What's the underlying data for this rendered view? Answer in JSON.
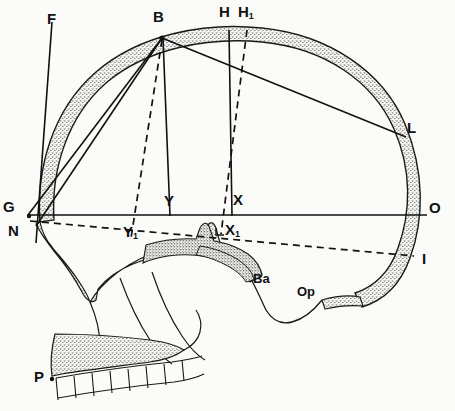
{
  "figure": {
    "caption": "",
    "background_color": "#fbfbfa",
    "ink_color": "#111111",
    "bone_fill_color": "#9a9a95"
  },
  "landmarks": [
    {
      "id": "F",
      "label": "F",
      "name": "frankfurt-reference-line-marker",
      "x": 52,
      "y": 20,
      "anchor_x": 52,
      "anchor_y": 22
    },
    {
      "id": "B",
      "label": "B",
      "name": "bregma",
      "x": 158,
      "y": 18,
      "anchor_x": 162,
      "anchor_y": 38
    },
    {
      "id": "H",
      "label": "H",
      "name": "vertex-height",
      "x": 225,
      "y": 14,
      "anchor_x": 230,
      "anchor_y": 30
    },
    {
      "id": "H1",
      "label": "H",
      "sub": "1",
      "name": "vertex-height-alt",
      "x": 243,
      "y": 14,
      "anchor_x": 248,
      "anchor_y": 30
    },
    {
      "id": "L",
      "label": "L",
      "name": "lambda",
      "x": 411,
      "y": 127,
      "anchor_x": 404,
      "anchor_y": 137
    },
    {
      "id": "G",
      "label": "G",
      "name": "glabella",
      "x": 6,
      "y": 205,
      "anchor_x": 28,
      "anchor_y": 215
    },
    {
      "id": "N",
      "label": "N",
      "name": "nasion",
      "x": 11,
      "y": 229,
      "anchor_x": 33,
      "anchor_y": 227
    },
    {
      "id": "Y",
      "label": "Y",
      "name": "bregma-projection",
      "x": 167,
      "y": 200,
      "anchor_x": 172,
      "anchor_y": 215
    },
    {
      "id": "Y1",
      "label": "Y",
      "sub": "1",
      "name": "bregma-projection-alt",
      "x": 127,
      "y": 230,
      "anchor_x": 134,
      "anchor_y": 232
    },
    {
      "id": "X",
      "label": "X",
      "name": "height-projection",
      "x": 236,
      "y": 199,
      "anchor_x": 231,
      "anchor_y": 215
    },
    {
      "id": "X1",
      "label": "X",
      "sub": "1",
      "name": "height-projection-alt",
      "x": 227,
      "y": 228,
      "anchor_x": 224,
      "anchor_y": 232
    },
    {
      "id": "O",
      "label": "O",
      "name": "opisthocranion",
      "x": 432,
      "y": 206,
      "anchor_x": 424,
      "anchor_y": 215
    },
    {
      "id": "I",
      "label": "I",
      "name": "inion",
      "x": 424,
      "y": 258,
      "anchor_x": 416,
      "anchor_y": 258
    },
    {
      "id": "Ba",
      "label": "Ba",
      "name": "basion",
      "x": 255,
      "y": 279,
      "anchor_x": 250,
      "anchor_y": 279
    },
    {
      "id": "Op",
      "label": "Op",
      "name": "opisthion",
      "x": 300,
      "y": 292,
      "anchor_x": 320,
      "anchor_y": 299
    },
    {
      "id": "P",
      "label": "P",
      "name": "prosthion",
      "x": 38,
      "y": 376,
      "anchor_x": 52,
      "anchor_y": 379
    }
  ],
  "measurement_lines": [
    {
      "name": "line-F-reference",
      "from": "F",
      "to": "G",
      "style": "solid",
      "description": "Frankfurt-oblique reference line"
    },
    {
      "name": "line-G-O-baseline",
      "from": "G",
      "to": "O",
      "style": "solid",
      "description": "Glabella-opisthocranion horizontal baseline"
    },
    {
      "name": "line-G-B",
      "from": "G",
      "to": "B",
      "style": "solid",
      "description": "Glabella to bregma chord"
    },
    {
      "name": "line-N-B",
      "from": "N",
      "to": "B",
      "style": "solid",
      "description": "Nasion to bregma chord"
    },
    {
      "name": "line-B-L",
      "from": "B",
      "to": "L",
      "style": "solid",
      "description": "Bregma to lambda chord"
    },
    {
      "name": "line-B-Y",
      "from": "B",
      "to": "Y",
      "style": "solid",
      "description": "Bregma vertical projection to baseline"
    },
    {
      "name": "line-H-X",
      "from": "H",
      "to": "X",
      "style": "solid",
      "description": "Vertex height vertical projection to baseline"
    },
    {
      "name": "line-B-Y1",
      "from": "B",
      "to": "Y1",
      "style": "dashed",
      "description": "Bregma perpendicular to G-I line"
    },
    {
      "name": "line-H1-X1",
      "from": "H1",
      "to": "X1",
      "style": "dashed",
      "description": "Vertex perpendicular to G-I line"
    },
    {
      "name": "line-G-I",
      "from": "G",
      "to": "I",
      "style": "dashed",
      "description": "Glabella to inion dashed baseline"
    }
  ],
  "legend_notes": {
    "solid_line": "solid",
    "dashed_line": "dashed"
  }
}
